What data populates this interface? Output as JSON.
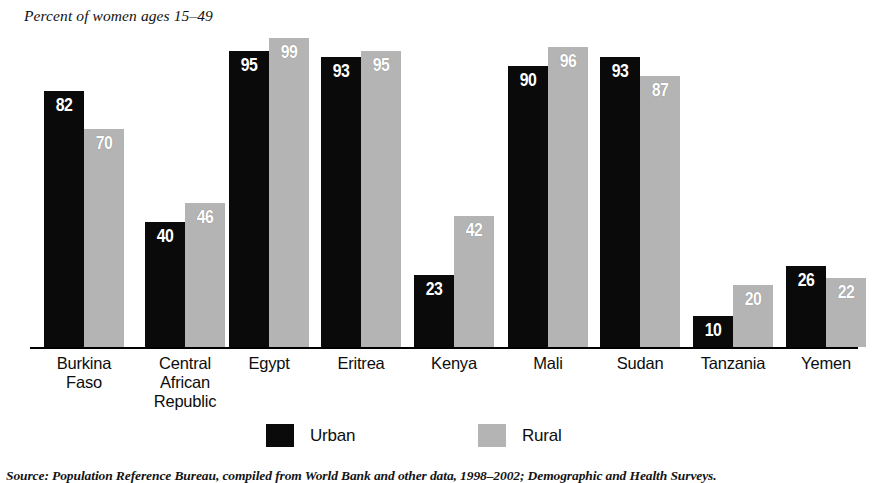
{
  "axis_note": "Percent of women ages 15–49",
  "source_note": "Source: Population Reference Bureau, compiled from World Bank and other data, 1998–2002; Demographic and Health Surveys.",
  "legend": {
    "position": "bottom-center",
    "items": [
      {
        "label": "Urban",
        "color": "#0a0a0a",
        "key": "urban"
      },
      {
        "label": "Rural",
        "color": "#b4b4b4",
        "key": "rural"
      }
    ]
  },
  "chart_data": {
    "type": "bar",
    "title": "",
    "subtitle": "",
    "xlabel": "",
    "ylabel": "Percent of women ages 15–49",
    "ylim": [
      0,
      100
    ],
    "grid": false,
    "legend_position": "bottom-center",
    "value_labels": true,
    "categories": [
      "Burkina Faso",
      "Central African Republic",
      "Egypt",
      "Eritrea",
      "Kenya",
      "Mali",
      "Sudan",
      "Tanzania",
      "Yemen"
    ],
    "category_lines": [
      [
        "Burkina",
        "Faso"
      ],
      [
        "Central",
        "African",
        "Republic"
      ],
      [
        "Egypt"
      ],
      [
        "Eritrea"
      ],
      [
        "Kenya"
      ],
      [
        "Mali"
      ],
      [
        "Sudan"
      ],
      [
        "Tanzania"
      ],
      [
        "Yemen"
      ]
    ],
    "series": [
      {
        "name": "Urban",
        "color": "#0a0a0a",
        "values": [
          82,
          40,
          95,
          93,
          23,
          90,
          93,
          10,
          26
        ]
      },
      {
        "name": "Rural",
        "color": "#b4b4b4",
        "values": [
          70,
          46,
          99,
          95,
          42,
          96,
          87,
          20,
          22
        ]
      }
    ]
  },
  "layout": {
    "baseline_y": 347,
    "px_per_unit": 3.12,
    "bar_width": 40,
    "group_left": [
      44,
      145,
      229,
      321,
      414,
      508,
      600,
      693,
      786
    ]
  }
}
